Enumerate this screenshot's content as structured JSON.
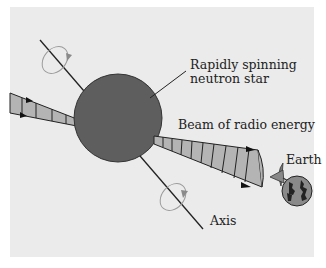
{
  "diagram": {
    "type": "pulsar-lighthouse-model",
    "labels": {
      "star_line1": "Rapidly spinning",
      "star_line2": "neutron star",
      "beam": "Beam of radio energy",
      "earth": "Earth",
      "axis": "Axis"
    },
    "colors": {
      "background": "#ebebeb",
      "star": "#5e5e5e",
      "beam": "#b4b4b4",
      "earth": "#8a8a8a",
      "lines": "#222222",
      "rotation_arrow": "#9a9a9a"
    }
  }
}
